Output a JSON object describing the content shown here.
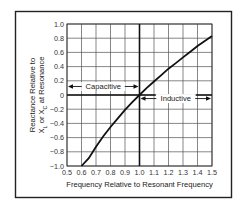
{
  "chart_data": {
    "type": "line",
    "title": "",
    "xlabel": "Frequency Relative to Resonant Frequency",
    "ylabel_line1": "Reactance Relative to",
    "ylabel_line2": "X_L or X_C at Resonance",
    "xlim": [
      0.5,
      1.5
    ],
    "ylim": [
      -1.0,
      1.0
    ],
    "grid": true,
    "legend": null,
    "x_ticks": [
      "0.5",
      "0.6",
      "0.7",
      "0.8",
      "0.9",
      "1.0",
      "1.1",
      "1.2",
      "1.3",
      "1.4",
      "1.5"
    ],
    "y_ticks": [
      "1.0",
      "0.8",
      "0.6",
      "0.4",
      "0.2",
      "0",
      "-0.2",
      "-0.4",
      "-0.6",
      "-0.8",
      "-1.0"
    ],
    "series": [
      {
        "name": "Relative reactance",
        "x": [
          0.6,
          0.65,
          0.7,
          0.75,
          0.8,
          0.85,
          0.9,
          0.95,
          1.0,
          1.05,
          1.1,
          1.15,
          1.2,
          1.25,
          1.3,
          1.35,
          1.4,
          1.45,
          1.5
        ],
        "y": [
          -1.0,
          -0.89,
          -0.73,
          -0.58,
          -0.45,
          -0.33,
          -0.21,
          -0.1,
          0.0,
          0.1,
          0.19,
          0.28,
          0.37,
          0.45,
          0.53,
          0.61,
          0.69,
          0.76,
          0.83
        ]
      }
    ],
    "annotations": [
      {
        "text": "Capacitive",
        "x_range": [
          0.5,
          1.0
        ],
        "y": 0.12,
        "arrows": "both"
      },
      {
        "text": "Inductive",
        "x_range": [
          1.0,
          1.5
        ],
        "y": -0.05,
        "arrows": "both"
      }
    ],
    "reference_lines": [
      {
        "orientation": "vertical",
        "x": 1.0
      },
      {
        "orientation": "horizontal",
        "y": 0
      }
    ]
  }
}
